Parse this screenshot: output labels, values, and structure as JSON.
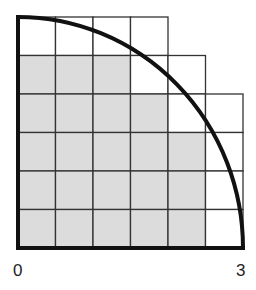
{
  "diagram": {
    "radius": 3,
    "grid_divisions": 6,
    "cell_size_units": 0.5,
    "labels": {
      "origin": "0",
      "radius_end": "3"
    },
    "colors": {
      "shaded": "#dcdcdc",
      "unshaded": "#ffffff",
      "grid_line": "#333333",
      "arc": "#111111"
    },
    "rows": [
      {
        "row": 1,
        "cells_drawn": 4,
        "cells_shaded": 0
      },
      {
        "row": 2,
        "cells_drawn": 5,
        "cells_shaded": 3
      },
      {
        "row": 3,
        "cells_drawn": 6,
        "cells_shaded": 4
      },
      {
        "row": 4,
        "cells_drawn": 6,
        "cells_shaded": 5
      },
      {
        "row": 5,
        "cells_drawn": 6,
        "cells_shaded": 5
      },
      {
        "row": 6,
        "cells_drawn": 6,
        "cells_shaded": 5
      }
    ],
    "total_shaded_cells": 22
  }
}
